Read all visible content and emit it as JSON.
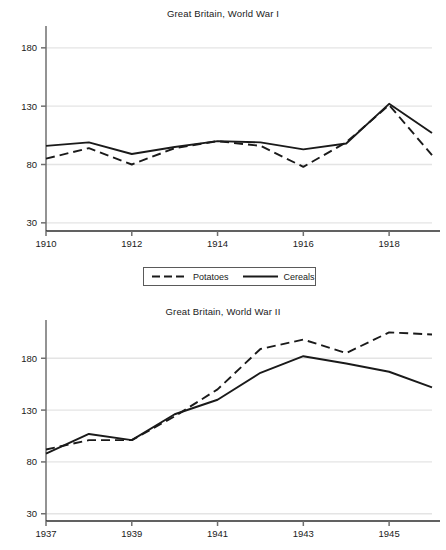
{
  "legend": {
    "items": [
      {
        "label": "Potatoes",
        "style": "dashed",
        "icon": "dashed-line-icon"
      },
      {
        "label": "Cereals",
        "style": "solid",
        "icon": "solid-line-icon"
      }
    ]
  },
  "chart_data": [
    {
      "id": "wwi",
      "type": "line",
      "title": "Great Britain, World War I",
      "xlabel": "",
      "ylabel": "",
      "grid": true,
      "legend_position": "bottom-center",
      "x": [
        1910,
        1911,
        1912,
        1913,
        1914,
        1915,
        1916,
        1917,
        1918,
        1919
      ],
      "xtick_labels": [
        "1910",
        "1912",
        "1914",
        "1916",
        "1918"
      ],
      "xticks": [
        1910,
        1912,
        1914,
        1916,
        1918
      ],
      "xlim": [
        1910,
        1919
      ],
      "ytick_labels": [
        "30",
        "80",
        "130",
        "180"
      ],
      "yticks": [
        30,
        80,
        130,
        180
      ],
      "ylim": [
        23,
        197
      ],
      "series": [
        {
          "name": "Potatoes",
          "style": "dashed",
          "values": [
            85,
            94,
            80,
            94,
            100,
            96,
            78,
            99,
            131,
            88
          ]
        },
        {
          "name": "Cereals",
          "style": "solid",
          "values": [
            96,
            99,
            89,
            95,
            100,
            99,
            93,
            98,
            132,
            107
          ]
        }
      ]
    },
    {
      "id": "wwii",
      "type": "line",
      "title": "Great Britain, World War II",
      "xlabel": "",
      "ylabel": "",
      "grid": true,
      "legend_position": "bottom-center",
      "x": [
        1937,
        1938,
        1939,
        1940,
        1941,
        1942,
        1943,
        1944,
        1945,
        1946
      ],
      "xtick_labels": [
        "1937",
        "1939",
        "1941",
        "1943",
        "1945"
      ],
      "xticks": [
        1937,
        1939,
        1941,
        1943,
        1945
      ],
      "xlim": [
        1937,
        1946
      ],
      "ytick_labels": [
        "30",
        "80",
        "130",
        "180"
      ],
      "yticks": [
        30,
        80,
        130,
        180
      ],
      "ylim": [
        23,
        215
      ],
      "series": [
        {
          "name": "Potatoes",
          "style": "dashed",
          "values": [
            92,
            101,
            101,
            124,
            150,
            189,
            198,
            185,
            205,
            203
          ]
        },
        {
          "name": "Cereals",
          "style": "solid",
          "values": [
            88,
            107,
            101,
            126,
            140,
            166,
            182,
            175,
            167,
            152
          ]
        }
      ]
    }
  ]
}
